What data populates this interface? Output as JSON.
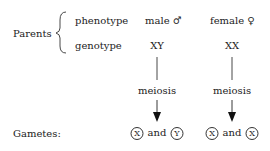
{
  "parents": {
    "label": "Parents",
    "rows": {
      "phenotype": {
        "label": "phenotype",
        "male": "male ♂",
        "female": "female ♀"
      },
      "genotype": {
        "label": "genotype",
        "male": "XY",
        "female": "XX"
      }
    }
  },
  "process": {
    "male": "meiosis",
    "female": "meiosis"
  },
  "gametes": {
    "label": "Gametes:",
    "male": {
      "a": "X",
      "join": "and",
      "b": "Y"
    },
    "female": {
      "a": "X",
      "join": "and",
      "b": "X"
    }
  }
}
